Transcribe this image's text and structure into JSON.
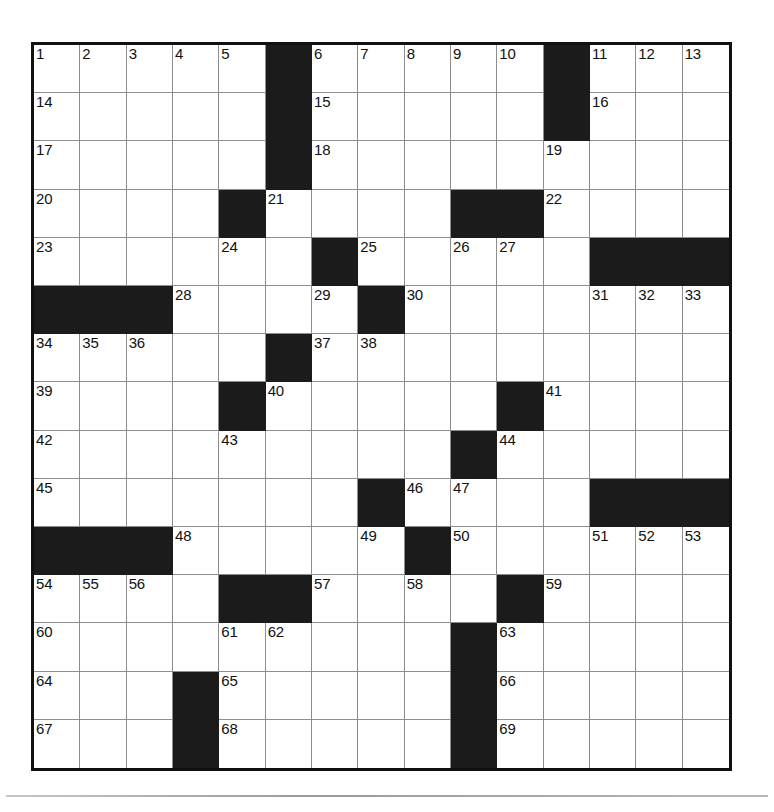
{
  "puzzle": {
    "type": "crossword-grid",
    "size": {
      "rows": 15,
      "cols": 15
    },
    "colors": {
      "block": "#1b1b1b",
      "open": "#ffffff",
      "gridline": "#8e8e8e",
      "border": "#111111"
    },
    "grid": [
      [
        0,
        0,
        0,
        0,
        0,
        1,
        0,
        0,
        0,
        0,
        0,
        1,
        0,
        0,
        0
      ],
      [
        0,
        0,
        0,
        0,
        0,
        1,
        0,
        0,
        0,
        0,
        0,
        1,
        0,
        0,
        0
      ],
      [
        0,
        0,
        0,
        0,
        0,
        1,
        0,
        0,
        0,
        0,
        0,
        0,
        0,
        0,
        0
      ],
      [
        0,
        0,
        0,
        0,
        1,
        0,
        0,
        0,
        0,
        1,
        1,
        0,
        0,
        0,
        0
      ],
      [
        0,
        0,
        0,
        0,
        0,
        0,
        1,
        0,
        0,
        0,
        0,
        0,
        1,
        1,
        1
      ],
      [
        1,
        1,
        1,
        0,
        0,
        0,
        0,
        1,
        0,
        0,
        0,
        0,
        0,
        0,
        0
      ],
      [
        0,
        0,
        0,
        0,
        0,
        1,
        0,
        0,
        0,
        0,
        0,
        0,
        0,
        0,
        0
      ],
      [
        0,
        0,
        0,
        0,
        1,
        0,
        0,
        0,
        0,
        0,
        1,
        0,
        0,
        0,
        0
      ],
      [
        0,
        0,
        0,
        0,
        0,
        0,
        0,
        0,
        0,
        1,
        0,
        0,
        0,
        0,
        0
      ],
      [
        0,
        0,
        0,
        0,
        0,
        0,
        0,
        1,
        0,
        0,
        0,
        0,
        1,
        1,
        1
      ],
      [
        1,
        1,
        1,
        0,
        0,
        0,
        0,
        0,
        1,
        0,
        0,
        0,
        0,
        0,
        0
      ],
      [
        0,
        0,
        0,
        0,
        1,
        1,
        0,
        0,
        0,
        0,
        1,
        0,
        0,
        0,
        0
      ],
      [
        0,
        0,
        0,
        0,
        0,
        0,
        0,
        0,
        0,
        1,
        0,
        0,
        0,
        0,
        0
      ],
      [
        0,
        0,
        0,
        1,
        0,
        0,
        0,
        0,
        0,
        1,
        0,
        0,
        0,
        0,
        0
      ],
      [
        0,
        0,
        0,
        1,
        0,
        0,
        0,
        0,
        0,
        1,
        0,
        0,
        0,
        0,
        0
      ]
    ],
    "numbers": [
      {
        "row": 0,
        "col": 0,
        "label": "1"
      },
      {
        "row": 0,
        "col": 1,
        "label": "2"
      },
      {
        "row": 0,
        "col": 2,
        "label": "3"
      },
      {
        "row": 0,
        "col": 3,
        "label": "4"
      },
      {
        "row": 0,
        "col": 4,
        "label": "5"
      },
      {
        "row": 0,
        "col": 6,
        "label": "6"
      },
      {
        "row": 0,
        "col": 7,
        "label": "7"
      },
      {
        "row": 0,
        "col": 8,
        "label": "8"
      },
      {
        "row": 0,
        "col": 9,
        "label": "9"
      },
      {
        "row": 0,
        "col": 10,
        "label": "10"
      },
      {
        "row": 0,
        "col": 12,
        "label": "11"
      },
      {
        "row": 0,
        "col": 13,
        "label": "12"
      },
      {
        "row": 0,
        "col": 14,
        "label": "13"
      },
      {
        "row": 1,
        "col": 0,
        "label": "14"
      },
      {
        "row": 1,
        "col": 6,
        "label": "15"
      },
      {
        "row": 1,
        "col": 12,
        "label": "16"
      },
      {
        "row": 2,
        "col": 0,
        "label": "17"
      },
      {
        "row": 2,
        "col": 6,
        "label": "18"
      },
      {
        "row": 2,
        "col": 11,
        "label": "19"
      },
      {
        "row": 3,
        "col": 0,
        "label": "20"
      },
      {
        "row": 3,
        "col": 5,
        "label": "21"
      },
      {
        "row": 3,
        "col": 11,
        "label": "22"
      },
      {
        "row": 4,
        "col": 0,
        "label": "23"
      },
      {
        "row": 4,
        "col": 4,
        "label": "24"
      },
      {
        "row": 4,
        "col": 7,
        "label": "25"
      },
      {
        "row": 4,
        "col": 9,
        "label": "26"
      },
      {
        "row": 4,
        "col": 10,
        "label": "27"
      },
      {
        "row": 5,
        "col": 3,
        "label": "28"
      },
      {
        "row": 5,
        "col": 6,
        "label": "29"
      },
      {
        "row": 5,
        "col": 8,
        "label": "30"
      },
      {
        "row": 5,
        "col": 12,
        "label": "31"
      },
      {
        "row": 5,
        "col": 13,
        "label": "32"
      },
      {
        "row": 5,
        "col": 14,
        "label": "33"
      },
      {
        "row": 6,
        "col": 0,
        "label": "34"
      },
      {
        "row": 6,
        "col": 1,
        "label": "35"
      },
      {
        "row": 6,
        "col": 2,
        "label": "36"
      },
      {
        "row": 6,
        "col": 6,
        "label": "37"
      },
      {
        "row": 6,
        "col": 7,
        "label": "38"
      },
      {
        "row": 7,
        "col": 0,
        "label": "39"
      },
      {
        "row": 7,
        "col": 5,
        "label": "40"
      },
      {
        "row": 7,
        "col": 11,
        "label": "41"
      },
      {
        "row": 8,
        "col": 0,
        "label": "42"
      },
      {
        "row": 8,
        "col": 4,
        "label": "43"
      },
      {
        "row": 8,
        "col": 10,
        "label": "44"
      },
      {
        "row": 9,
        "col": 0,
        "label": "45"
      },
      {
        "row": 9,
        "col": 8,
        "label": "46"
      },
      {
        "row": 9,
        "col": 9,
        "label": "47"
      },
      {
        "row": 10,
        "col": 3,
        "label": "48"
      },
      {
        "row": 10,
        "col": 7,
        "label": "49"
      },
      {
        "row": 10,
        "col": 9,
        "label": "50"
      },
      {
        "row": 10,
        "col": 12,
        "label": "51"
      },
      {
        "row": 10,
        "col": 13,
        "label": "52"
      },
      {
        "row": 10,
        "col": 14,
        "label": "53"
      },
      {
        "row": 11,
        "col": 0,
        "label": "54"
      },
      {
        "row": 11,
        "col": 1,
        "label": "55"
      },
      {
        "row": 11,
        "col": 2,
        "label": "56"
      },
      {
        "row": 11,
        "col": 6,
        "label": "57"
      },
      {
        "row": 11,
        "col": 8,
        "label": "58"
      },
      {
        "row": 11,
        "col": 11,
        "label": "59"
      },
      {
        "row": 12,
        "col": 0,
        "label": "60"
      },
      {
        "row": 12,
        "col": 4,
        "label": "61"
      },
      {
        "row": 12,
        "col": 5,
        "label": "62"
      },
      {
        "row": 12,
        "col": 10,
        "label": "63"
      },
      {
        "row": 13,
        "col": 0,
        "label": "64"
      },
      {
        "row": 13,
        "col": 4,
        "label": "65"
      },
      {
        "row": 13,
        "col": 10,
        "label": "66"
      },
      {
        "row": 14,
        "col": 0,
        "label": "67"
      },
      {
        "row": 14,
        "col": 4,
        "label": "68"
      },
      {
        "row": 14,
        "col": 10,
        "label": "69"
      }
    ],
    "entries": []
  }
}
